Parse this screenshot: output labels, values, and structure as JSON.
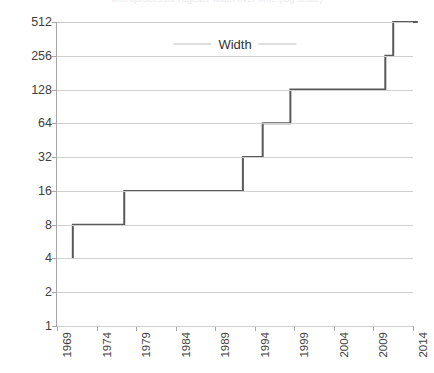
{
  "top_cut_title": "Microprocessor register width over time (log scale)",
  "legend": {
    "label": "Width"
  },
  "chart_data": {
    "type": "line",
    "step": "post",
    "title": "Width",
    "xlabel": "",
    "ylabel": "",
    "xlim": [
      1969,
      2014
    ],
    "ylim": [
      1,
      512
    ],
    "yscale": "log2",
    "grid": true,
    "legend_position": "top-center",
    "y_ticks": [
      1,
      2,
      4,
      8,
      16,
      32,
      64,
      128,
      256,
      512
    ],
    "y_tick_labels": [
      "1",
      "2",
      "4",
      "8",
      "16",
      "32",
      "64",
      "128",
      "256",
      "512"
    ],
    "x_ticks": [
      1969,
      1974,
      1979,
      1984,
      1989,
      1994,
      1999,
      2004,
      2009,
      2014
    ],
    "x_tick_labels": [
      "1969",
      "1974",
      "1979",
      "1984",
      "1989",
      "1994",
      "1999",
      "2004",
      "2009",
      "2014"
    ],
    "series": [
      {
        "name": "Width",
        "color": "#595959",
        "x": [
          1971,
          1971,
          1977.5,
          1977.5,
          1992.5,
          1992.5,
          1995,
          1995,
          1998.5,
          1998.5,
          2010.5,
          2010.5,
          2011.5,
          2011.5,
          2014.6
        ],
        "values": [
          4,
          8,
          8,
          16,
          16,
          32,
          32,
          64,
          64,
          128,
          128,
          256,
          256,
          512,
          512
        ],
        "steps": [
          {
            "year": 1971,
            "value": 4
          },
          {
            "year": 1971,
            "value": 8
          },
          {
            "year": 1977.5,
            "value": 16
          },
          {
            "year": 1992.5,
            "value": 32
          },
          {
            "year": 1995,
            "value": 64
          },
          {
            "year": 1998.5,
            "value": 128
          },
          {
            "year": 2010.5,
            "value": 256
          },
          {
            "year": 2011.5,
            "value": 512
          }
        ]
      }
    ]
  },
  "colors": {
    "series_line": "#595959",
    "gridline": "#d0d0d0",
    "axis": "#a6a6a6",
    "tick_text": "#404040",
    "legend_text": "#333333",
    "legend_swatch": "#bfbfbf",
    "background": "#ffffff"
  }
}
